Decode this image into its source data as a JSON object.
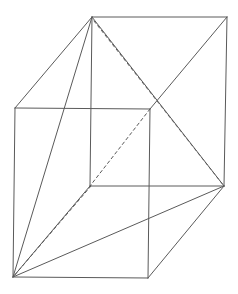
{
  "diagram": {
    "stroke_color": "#5a5a5a",
    "background": "#ffffff",
    "vertices": {
      "A": [
        13,
        277
      ],
      "B": [
        148,
        278
      ],
      "C": [
        224,
        186
      ],
      "D": [
        90,
        186
      ],
      "E": [
        15,
        108
      ],
      "F": [
        150,
        109
      ],
      "G": [
        227,
        17
      ],
      "H": [
        92,
        17
      ]
    },
    "edges": [
      {
        "from": "A",
        "to": "B",
        "style": "solid"
      },
      {
        "from": "B",
        "to": "C",
        "style": "solid"
      },
      {
        "from": "D",
        "to": "C",
        "style": "solid"
      },
      {
        "from": "A",
        "to": "D",
        "style": "solid"
      },
      {
        "from": "E",
        "to": "F",
        "style": "solid"
      },
      {
        "from": "F",
        "to": "G",
        "style": "solid"
      },
      {
        "from": "H",
        "to": "G",
        "style": "solid"
      },
      {
        "from": "E",
        "to": "H",
        "style": "solid"
      },
      {
        "from": "A",
        "to": "E",
        "style": "solid"
      },
      {
        "from": "B",
        "to": "F",
        "style": "solid"
      },
      {
        "from": "C",
        "to": "G",
        "style": "solid"
      },
      {
        "from": "D",
        "to": "H",
        "style": "solid"
      }
    ],
    "diagonals": [
      {
        "from": "A",
        "to": "H",
        "style": "solid"
      },
      {
        "from": "A",
        "to": "C",
        "style": "solid"
      },
      {
        "from": "H",
        "to": "C",
        "style": "solid"
      },
      {
        "from": "H",
        "to": "C",
        "style": "dashed",
        "offset": [
          2,
          4
        ]
      },
      {
        "from": "F",
        "to": "D",
        "style": "dashed"
      },
      {
        "from": "D",
        "to": "A",
        "style": "dashed",
        "offset": [
          1,
          0
        ]
      }
    ]
  }
}
